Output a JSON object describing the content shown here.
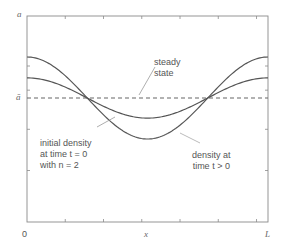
{
  "diagram": {
    "y_axis": {
      "top_label": "a",
      "mean_label": "ā"
    },
    "x_axis": {
      "left_label": "0",
      "mid_label": "x",
      "right_label": "L"
    },
    "annotations": {
      "steady_state": "steady\nstate",
      "initial_density": "initial density\nat time t = 0\nwith n = 2",
      "density_later": "density at\ntime t > 0"
    },
    "colors": {
      "frame": "#8a8a8a",
      "curve": "#555555",
      "dashed": "#777777",
      "leader": "#aaaaaa",
      "text": "#555555"
    }
  },
  "chart_data": {
    "type": "line",
    "title": "",
    "xlabel": "x",
    "ylabel": "a",
    "x_range": [
      0,
      1
    ],
    "x_ticks": [
      "0",
      "x",
      "L"
    ],
    "y_ticks": [
      "ā",
      "a"
    ],
    "grid": false,
    "series": [
      {
        "name": "initial density at time t = 0 with n = 2",
        "form": "ā + A0·cos(2πx/L)",
        "relative_amplitude": 1.0
      },
      {
        "name": "density at time t > 0",
        "form": "ā + A(t)·cos(2πx/L)",
        "relative_amplitude": 0.49
      },
      {
        "name": "steady state",
        "form": "ā (constant)",
        "relative_amplitude": 0.0,
        "style": "dashed"
      }
    ]
  }
}
